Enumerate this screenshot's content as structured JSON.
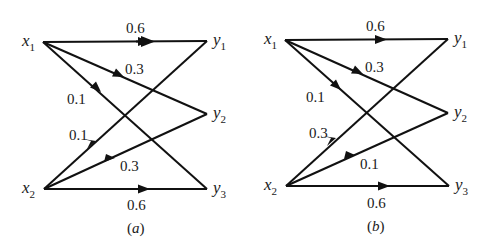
{
  "diagrams": [
    {
      "caption": "(a)",
      "caption_letter": "a",
      "offset_x": 0,
      "offset_y": 0,
      "nodes": {
        "x1": {
          "label": "x",
          "sub": "1",
          "x": 43,
          "y": 42
        },
        "x2": {
          "label": "x",
          "sub": "2",
          "x": 44,
          "y": 189
        },
        "y1": {
          "label": "y",
          "sub": "1",
          "x": 207,
          "y": 41
        },
        "y2": {
          "label": "y",
          "sub": "2",
          "x": 207,
          "y": 114
        },
        "y3": {
          "label": "y",
          "sub": "3",
          "x": 207,
          "y": 189
        }
      },
      "edges": [
        {
          "from": "x1",
          "to": "y1",
          "prob": "0.6"
        },
        {
          "from": "x1",
          "to": "y2",
          "prob": "0.3"
        },
        {
          "from": "x1",
          "to": "y3",
          "prob": "0.1"
        },
        {
          "from": "x2",
          "to": "y1",
          "prob": "0.1"
        },
        {
          "from": "x2",
          "to": "y2",
          "prob": "0.3"
        },
        {
          "from": "x2",
          "to": "y3",
          "prob": "0.6"
        }
      ]
    },
    {
      "caption": "(b)",
      "caption_letter": "b",
      "nodes": {
        "x1": {
          "label": "x",
          "sub": "1",
          "x": 285,
          "y": 40
        },
        "x2": {
          "label": "x",
          "sub": "2",
          "x": 286,
          "y": 186
        },
        "y1": {
          "label": "y",
          "sub": "1",
          "x": 448,
          "y": 39
        },
        "y2": {
          "label": "y",
          "sub": "2",
          "x": 448,
          "y": 113
        },
        "y3": {
          "label": "y",
          "sub": "3",
          "x": 449,
          "y": 186
        }
      },
      "edges": [
        {
          "from": "x1",
          "to": "y1",
          "prob": "0.6"
        },
        {
          "from": "x1",
          "to": "y2",
          "prob": "0.3"
        },
        {
          "from": "x1",
          "to": "y3",
          "prob": "0.1"
        },
        {
          "from": "x2",
          "to": "y1",
          "prob": "0.3"
        },
        {
          "from": "x2",
          "to": "y2",
          "prob": "0.1"
        },
        {
          "from": "x2",
          "to": "y3",
          "prob": "0.6"
        }
      ]
    }
  ]
}
